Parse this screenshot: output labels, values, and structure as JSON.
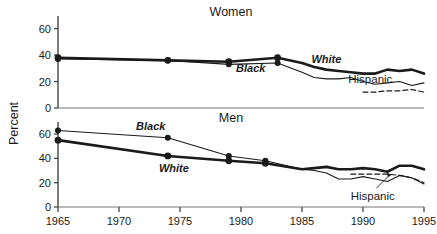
{
  "chart_data": {
    "type": "line",
    "title": "",
    "xlabel": "",
    "ylabel": "Percent",
    "xlim": [
      1965,
      1995
    ],
    "ylim": [
      0,
      65
    ],
    "xticks": [
      1965,
      1970,
      1975,
      1980,
      1985,
      1990,
      1995
    ],
    "yticks": [
      0,
      20,
      40,
      60
    ],
    "grid": false,
    "legend": "inline-annotations",
    "panels": [
      {
        "name": "women",
        "title": "Women",
        "yticks": [
          0,
          20,
          40,
          60
        ],
        "series": [
          {
            "name": "White",
            "style": "thick-solid",
            "markers": true,
            "label": "White",
            "x": [
              1965,
              1974,
              1979,
              1983,
              1985,
              1986,
              1987,
              1988,
              1989,
              1990,
              1991,
              1992,
              1993,
              1994,
              1995
            ],
            "y": [
              38,
              36,
              35,
              38,
              34,
              31,
              29,
              28,
              27,
              26,
              26,
              29,
              28,
              29,
              26
            ]
          },
          {
            "name": "Black",
            "style": "thin-solid",
            "markers": true,
            "label": "Black",
            "x": [
              1965,
              1974,
              1979,
              1983,
              1985,
              1986,
              1987,
              1988,
              1989,
              1990,
              1991,
              1992,
              1993,
              1994,
              1995
            ],
            "y": [
              37,
              36,
              33,
              34,
              27,
              23,
              22,
              22,
              23,
              20,
              18,
              19,
              20,
              17,
              19
            ]
          },
          {
            "name": "Hispanic",
            "style": "dashed",
            "markers": false,
            "label": "Hispanic",
            "x": [
              1990,
              1991,
              1992,
              1993,
              1994,
              1995
            ],
            "y": [
              12,
              12,
              13,
              13,
              14,
              12
            ]
          }
        ]
      },
      {
        "name": "men",
        "title": "Men",
        "yticks": [
          0,
          20,
          40,
          60
        ],
        "series": [
          {
            "name": "White",
            "style": "thick-solid",
            "markers": true,
            "label": "White",
            "x": [
              1965,
              1974,
              1979,
              1982,
              1985,
              1986,
              1987,
              1988,
              1989,
              1990,
              1991,
              1992,
              1993,
              1994,
              1995
            ],
            "y": [
              55,
              42,
              38,
              36,
              31,
              32,
              33,
              31,
              31,
              32,
              31,
              29,
              34,
              34,
              31
            ]
          },
          {
            "name": "Black",
            "style": "thin-solid",
            "markers": true,
            "label": "Black",
            "x": [
              1965,
              1974,
              1979,
              1982,
              1985,
              1986,
              1987,
              1988,
              1989,
              1990,
              1991,
              1992,
              1993,
              1994,
              1995
            ],
            "y": [
              63,
              57,
              42,
              38,
              31,
              30,
              28,
              23,
              23,
              25,
              23,
              21,
              26,
              24,
              19
            ]
          },
          {
            "name": "Hispanic",
            "style": "dashed",
            "markers": false,
            "label": "Hispanic",
            "x": [
              1989,
              1990,
              1991,
              1992,
              1993,
              1994,
              1995
            ],
            "y": [
              27,
              27,
              27,
              27,
              26,
              24,
              20
            ]
          }
        ]
      }
    ],
    "annotations": [
      {
        "panel": "women",
        "text": "White",
        "x": 1987.0,
        "y": 34
      },
      {
        "panel": "women",
        "text": "Black",
        "x": 1980.8,
        "y": 27
      },
      {
        "panel": "women",
        "text": "Hispanic",
        "x": 1990.6,
        "y": 19
      },
      {
        "panel": "men",
        "text": "Black",
        "x": 1972.6,
        "y": 63
      },
      {
        "panel": "men",
        "text": "White",
        "x": 1974.5,
        "y": 29
      },
      {
        "panel": "men",
        "text": "Hispanic",
        "x": 1990.8,
        "y": 6
      }
    ]
  },
  "colors": {
    "ink": "#1a1a1a",
    "axis": "#3a3a3a",
    "background": "#ffffff"
  }
}
